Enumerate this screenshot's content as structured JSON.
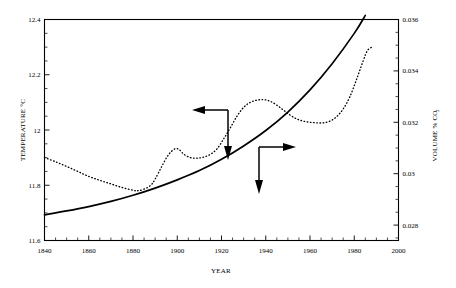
{
  "chart_data": {
    "type": "line",
    "title": "",
    "subtitle": "",
    "xlabel": "YEAR",
    "ylabel": "TEMPERATURE °C",
    "y2label_main": "VOLUME % CO",
    "y2label_sub": "2",
    "xlim": [
      1840,
      2000
    ],
    "ylim": [
      11.6,
      12.4
    ],
    "y2lim": [
      0.0274,
      0.036
    ],
    "grid": false,
    "legend_position": "none",
    "x_major_ticks": [
      "1840",
      "1860",
      "1880",
      "1900",
      "1920",
      "1940",
      "1960",
      "1980",
      "2000"
    ],
    "x_major_values": [
      1840,
      1860,
      1880,
      1900,
      1920,
      1940,
      1960,
      1980,
      2000
    ],
    "x_minor_step": 5,
    "y_major_ticks": [
      "12.4",
      "12.2",
      "12",
      "11.8",
      "11.6"
    ],
    "y_major_values": [
      12.4,
      12.2,
      12.0,
      11.8,
      11.6
    ],
    "y_minor_step": 0.05,
    "y2_major_ticks": [
      "0.036",
      "0.034",
      "0.032",
      "0.03",
      "0.028"
    ],
    "y2_major_values": [
      0.036,
      0.034,
      0.032,
      0.03,
      0.028
    ],
    "y2_minor_step": 0.0005,
    "series": [
      {
        "name": "Temperature",
        "style": "dotted",
        "axis": "left",
        "x": [
          1840,
          1845,
          1850,
          1855,
          1860,
          1865,
          1870,
          1875,
          1880,
          1882,
          1885,
          1888,
          1890,
          1893,
          1896,
          1899,
          1901,
          1903,
          1906,
          1909,
          1912,
          1915,
          1918,
          1921,
          1924,
          1927,
          1930,
          1933,
          1936,
          1939,
          1942,
          1945,
          1948,
          1951,
          1954,
          1957,
          1960,
          1963,
          1966,
          1969,
          1972,
          1975,
          1978,
          1981,
          1984,
          1986,
          1988
        ],
        "y": [
          11.9,
          11.885,
          11.868,
          11.85,
          11.832,
          11.818,
          11.805,
          11.792,
          11.782,
          11.78,
          11.786,
          11.8,
          11.822,
          11.868,
          11.91,
          11.932,
          11.928,
          11.912,
          11.9,
          11.898,
          11.902,
          11.912,
          11.932,
          11.968,
          12.008,
          12.05,
          12.082,
          12.1,
          12.108,
          12.11,
          12.104,
          12.09,
          12.072,
          12.054,
          12.04,
          12.032,
          12.028,
          12.026,
          12.026,
          12.032,
          12.048,
          12.076,
          12.12,
          12.182,
          12.25,
          12.288,
          12.3
        ]
      },
      {
        "name": "CO2 Volume %",
        "style": "solid",
        "axis": "right",
        "x": [
          1840,
          1850,
          1860,
          1870,
          1880,
          1890,
          1900,
          1910,
          1920,
          1930,
          1940,
          1950,
          1960,
          1970,
          1980,
          1985
        ],
        "y": [
          0.0284,
          0.02855,
          0.02872,
          0.02892,
          0.02916,
          0.02944,
          0.02976,
          0.03012,
          0.03056,
          0.03108,
          0.03168,
          0.0324,
          0.03326,
          0.03428,
          0.03546,
          0.03616
        ]
      }
    ],
    "annotations": [
      {
        "name": "temperature-pointer",
        "description": "Elbow arrow pointing left to the dotted temperature curve and down",
        "arms": [
          "left",
          "down"
        ]
      },
      {
        "name": "co2-pointer",
        "description": "Elbow arrow pointing right and down from the solid CO2 curve",
        "arms": [
          "right",
          "down"
        ]
      }
    ]
  }
}
